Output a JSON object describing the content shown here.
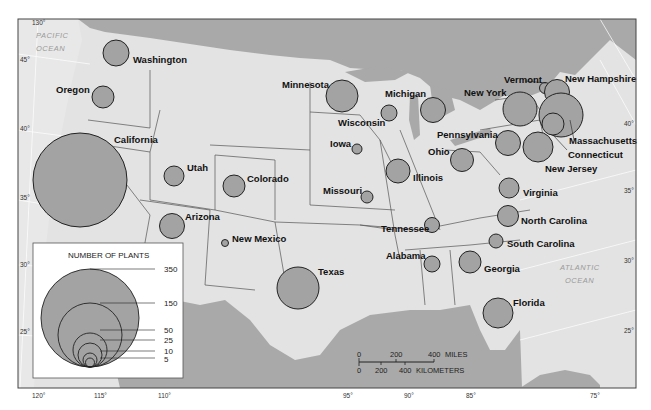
{
  "map": {
    "title_hidden": "Number of plants by state",
    "colors": {
      "water": "#a9a9a9",
      "land": "#e3e3e3",
      "bubble": "#a3a3a3",
      "border": "#555555"
    },
    "oceans": [
      {
        "line1": "PACIFIC",
        "line2": "OCEAN"
      },
      {
        "line1": "ATLANTIC",
        "line2": "OCEAN"
      }
    ],
    "longitude_ticks": [
      "130°",
      "120°",
      "115°",
      "110°",
      "95°",
      "90°",
      "85°",
      "75°"
    ],
    "latitude_ticks_left": [
      "45°",
      "40°",
      "35°",
      "30°",
      "25°"
    ],
    "latitude_ticks_right": [
      "40°",
      "35°",
      "30°",
      "25°"
    ]
  },
  "states": [
    {
      "name": "Washington"
    },
    {
      "name": "Oregon"
    },
    {
      "name": "California"
    },
    {
      "name": "Utah"
    },
    {
      "name": "Colorado"
    },
    {
      "name": "Arizona"
    },
    {
      "name": "New Mexico"
    },
    {
      "name": "Texas"
    },
    {
      "name": "Minnesota"
    },
    {
      "name": "Wisconsin"
    },
    {
      "name": "Iowa"
    },
    {
      "name": "Missouri"
    },
    {
      "name": "Illinois"
    },
    {
      "name": "Michigan"
    },
    {
      "name": "Ohio"
    },
    {
      "name": "Pennsylvania"
    },
    {
      "name": "New York"
    },
    {
      "name": "Vermont"
    },
    {
      "name": "New Hampshire"
    },
    {
      "name": "Massachusetts"
    },
    {
      "name": "Connecticut"
    },
    {
      "name": "New Jersey"
    },
    {
      "name": "Virginia"
    },
    {
      "name": "North Carolina"
    },
    {
      "name": "South Carolina"
    },
    {
      "name": "Tennessee"
    },
    {
      "name": "Alabama"
    },
    {
      "name": "Georgia"
    },
    {
      "name": "Florida"
    }
  ],
  "legend": {
    "title": "NUMBER OF PLANTS",
    "values": [
      "350",
      "150",
      "50",
      "25",
      "10",
      "5"
    ]
  },
  "scale": {
    "miles": {
      "labels": [
        "0",
        "200",
        "400"
      ],
      "unit": "MILES"
    },
    "kilometers": {
      "labels": [
        "0",
        "200",
        "400"
      ],
      "unit": "KILOMETERS"
    }
  }
}
